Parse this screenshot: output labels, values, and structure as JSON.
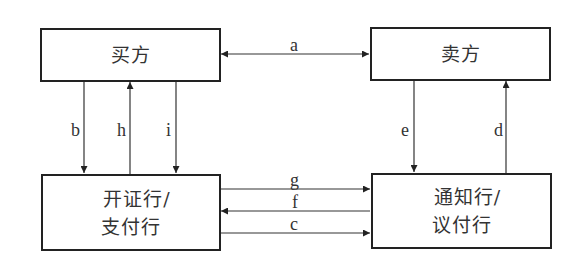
{
  "diagram": {
    "nodes": {
      "buyer": {
        "label": "买方"
      },
      "seller": {
        "label": "卖方"
      },
      "issuing_bank": {
        "line1": "开证行/",
        "line2": "支付行"
      },
      "advising_bank": {
        "line1": "通知行/",
        "line2": "议付行"
      }
    },
    "edges": {
      "a": {
        "label": "a",
        "from": "buyer",
        "to": "seller",
        "bidirectional": true
      },
      "b": {
        "label": "b",
        "from": "buyer",
        "to": "issuing_bank"
      },
      "h": {
        "label": "h",
        "from": "issuing_bank",
        "to": "buyer"
      },
      "i": {
        "label": "i",
        "from": "buyer",
        "to": "issuing_bank"
      },
      "e": {
        "label": "e",
        "from": "seller",
        "to": "advising_bank"
      },
      "d": {
        "label": "d",
        "from": "advising_bank",
        "to": "seller"
      },
      "g": {
        "label": "g",
        "from": "issuing_bank",
        "to": "advising_bank"
      },
      "f": {
        "label": "f",
        "from": "advising_bank",
        "to": "issuing_bank"
      },
      "c": {
        "label": "c",
        "from": "issuing_bank",
        "to": "advising_bank"
      }
    },
    "colors": {
      "stroke": "#222222",
      "text": "#333333",
      "background": "#ffffff"
    }
  }
}
